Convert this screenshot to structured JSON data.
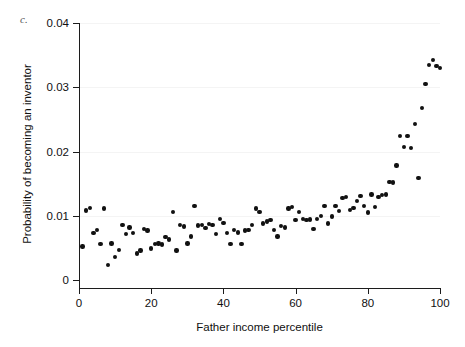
{
  "figure": {
    "panel_label": "c.",
    "page_artifact": "",
    "background_color": "#ffffff",
    "marker_color": "#111111",
    "axis_color": "#1c1c1c"
  },
  "chart_data": {
    "type": "scatter",
    "title": "",
    "xlabel": "Father income percentile",
    "ylabel": "Probability of becoming an inventor",
    "xlim": [
      0,
      100
    ],
    "ylim": [
      0,
      0.04
    ],
    "xticks": [
      0,
      20,
      40,
      60,
      80,
      100
    ],
    "xtick_labels": [
      "0",
      "20",
      "40",
      "60",
      "80",
      "100"
    ],
    "yticks": [
      0,
      0.01,
      0.02,
      0.03,
      0.04
    ],
    "ytick_labels": [
      "0",
      "0.01",
      "0.02",
      "0.03",
      "0.04"
    ],
    "grid": false,
    "legend": null,
    "marker": "filled-circle",
    "series": [
      {
        "name": "Probability of becoming an inventor",
        "x": [
          1,
          2,
          3,
          4,
          5,
          6,
          7,
          8,
          9,
          10,
          11,
          12,
          13,
          14,
          15,
          16,
          17,
          18,
          19,
          20,
          21,
          22,
          23,
          24,
          25,
          26,
          27,
          28,
          29,
          30,
          31,
          32,
          33,
          34,
          35,
          36,
          37,
          38,
          39,
          40,
          41,
          42,
          43,
          44,
          45,
          46,
          47,
          48,
          49,
          50,
          51,
          52,
          53,
          54,
          55,
          56,
          57,
          58,
          59,
          60,
          61,
          62,
          63,
          64,
          65,
          66,
          67,
          68,
          69,
          70,
          71,
          72,
          73,
          74,
          75,
          76,
          77,
          78,
          79,
          80,
          81,
          82,
          83,
          84,
          85,
          86,
          87,
          88,
          89,
          90,
          91,
          92,
          93,
          94,
          95,
          96,
          97,
          98,
          99,
          100
        ],
        "y": [
          0.0052,
          0.0108,
          0.0112,
          0.0073,
          0.0078,
          0.0056,
          0.0111,
          0.0023,
          0.0057,
          0.0036,
          0.0047,
          0.0086,
          0.0072,
          0.0082,
          0.0073,
          0.0041,
          0.0046,
          0.0079,
          0.0077,
          0.0049,
          0.0056,
          0.0057,
          0.0055,
          0.0067,
          0.0063,
          0.0106,
          0.0046,
          0.0086,
          0.0083,
          0.0057,
          0.0068,
          0.0115,
          0.0085,
          0.0086,
          0.0081,
          0.0087,
          0.0086,
          0.0072,
          0.0095,
          0.0089,
          0.0073,
          0.0056,
          0.0078,
          0.0074,
          0.0056,
          0.0077,
          0.0078,
          0.0086,
          0.0111,
          0.0106,
          0.0088,
          0.0091,
          0.0093,
          0.0078,
          0.0068,
          0.0084,
          0.0082,
          0.0111,
          0.0114,
          0.0093,
          0.0106,
          0.0095,
          0.0093,
          0.0094,
          0.0079,
          0.0095,
          0.01,
          0.0115,
          0.0088,
          0.0099,
          0.0115,
          0.0107,
          0.0128,
          0.0129,
          0.0109,
          0.0112,
          0.0123,
          0.0131,
          0.0115,
          0.0105,
          0.0133,
          0.0114,
          0.0129,
          0.0132,
          0.0133,
          0.0153,
          0.0152,
          0.0178,
          0.0224,
          0.0207,
          0.0224,
          0.0205,
          0.0243,
          0.0159,
          0.0268,
          0.0305,
          0.0335,
          0.0342,
          0.0333,
          0.033
        ]
      }
    ]
  }
}
